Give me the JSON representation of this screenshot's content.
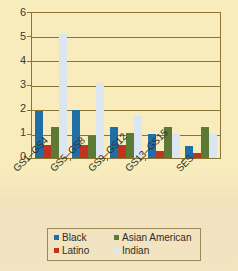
{
  "chart_data": {
    "type": "bar",
    "title": "",
    "subtitle": "",
    "xlabel": "",
    "ylabel": "",
    "ylim": [
      0,
      6
    ],
    "yticks": [
      0,
      1,
      2,
      3,
      4,
      5,
      6
    ],
    "ytick_labels": [
      "0",
      "1",
      "2",
      "3",
      "4",
      "5",
      "6"
    ],
    "grid": true,
    "grid_axis": "y",
    "legend_position": "bottom",
    "orientation": "vertical",
    "categories": [
      "GS1–GS4",
      "GS5–GS8",
      "GS9–GS12",
      "GS13–GS15",
      "SES"
    ],
    "series": [
      {
        "name": "Black",
        "color": "#1f6ea8",
        "values": [
          1.95,
          2.0,
          1.3,
          1.0,
          0.5
        ]
      },
      {
        "name": "Latino",
        "color": "#c0341f",
        "values": [
          0.55,
          0.55,
          0.55,
          0.3,
          0.2
        ]
      },
      {
        "name": "Asian American",
        "color": "#5c7a35",
        "values": [
          1.3,
          0.9,
          1.05,
          1.3,
          1.3
        ]
      },
      {
        "name": "Indian",
        "color": "#dbe6f2",
        "values": [
          5.15,
          3.1,
          1.75,
          1.0,
          1.0
        ]
      }
    ]
  },
  "legend": {
    "entries": [
      {
        "label": "Black",
        "color": "#1f6ea8"
      },
      {
        "label": "Asian American",
        "color": "#5c7a35"
      },
      {
        "label": "Latino",
        "color": "#c0341f"
      },
      {
        "label": "Indian",
        "color": "#dbe6f2"
      }
    ]
  },
  "colors": {
    "background": "#f8ecbd",
    "axis": "#8a7435",
    "text": "#332f28"
  }
}
